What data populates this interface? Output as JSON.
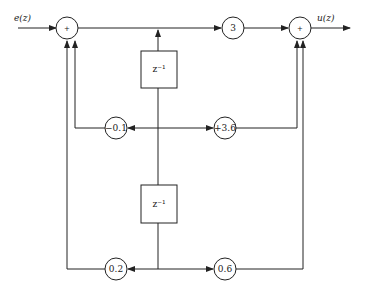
{
  "diagram": {
    "type": "signal-flow block diagram (digital filter, two delays)",
    "input_label": "e(z)",
    "output_label": "u(z)",
    "summers": [
      {
        "id": "sum-left",
        "symbol": "+"
      },
      {
        "id": "sum-right",
        "symbol": "+"
      }
    ],
    "forward_gain": "3",
    "delays": [
      {
        "id": "delay-1",
        "label": "z⁻¹"
      },
      {
        "id": "delay-2",
        "label": "z⁻¹"
      }
    ],
    "gains": {
      "feedback_1": "−0.1",
      "feedforward_1": "+3.6",
      "feedback_2": "0.2",
      "feedforward_2": "0.6"
    },
    "colors": {
      "stroke": "#222222",
      "background": "#ffffff"
    }
  }
}
